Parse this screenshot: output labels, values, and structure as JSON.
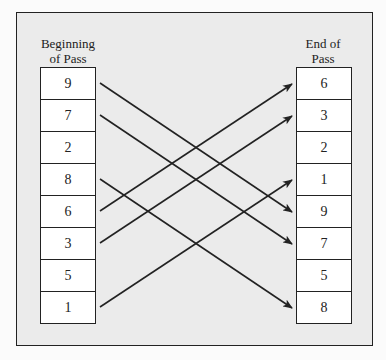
{
  "diagram": {
    "left_column": {
      "label_lines": [
        "Beginning",
        "of Pass"
      ],
      "values": [
        "9",
        "7",
        "2",
        "8",
        "6",
        "3",
        "5",
        "1"
      ]
    },
    "right_column": {
      "label_lines": [
        "End of",
        "Pass"
      ],
      "values": [
        "6",
        "3",
        "2",
        "1",
        "9",
        "7",
        "5",
        "8"
      ]
    },
    "arrows": [
      {
        "from_index": 0,
        "value": "9",
        "to_index": 4
      },
      {
        "from_index": 1,
        "value": "7",
        "to_index": 5
      },
      {
        "from_index": 3,
        "value": "8",
        "to_index": 7
      },
      {
        "from_index": 4,
        "value": "6",
        "to_index": 0
      },
      {
        "from_index": 5,
        "value": "3",
        "to_index": 1
      },
      {
        "from_index": 7,
        "value": "1",
        "to_index": 3
      }
    ],
    "colors": {
      "frame_background": "#ebebeb",
      "cell_background": "#ffffff",
      "stroke": "#222222"
    }
  }
}
